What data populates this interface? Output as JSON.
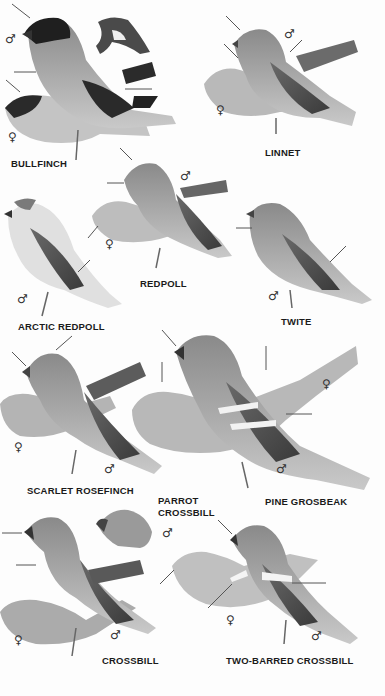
{
  "plate": {
    "title": "Finches plate",
    "background": "#fdfdfd"
  },
  "species": [
    {
      "id": "bullfinch",
      "label": "BULLFINCH",
      "sexes": [
        "male",
        "female"
      ]
    },
    {
      "id": "linnet",
      "label": "LINNET",
      "sexes": [
        "male",
        "female"
      ]
    },
    {
      "id": "redpoll",
      "label": "REDPOLL",
      "sexes": [
        "male",
        "female"
      ]
    },
    {
      "id": "arctic_redpoll",
      "label": "ARCTIC REDPOLL",
      "sexes": [
        "male"
      ]
    },
    {
      "id": "twite",
      "label": "TWITE",
      "sexes": [
        "male"
      ]
    },
    {
      "id": "scarlet_rosefinch",
      "label": "SCARLET ROSEFINCH",
      "sexes": [
        "female",
        "male"
      ]
    },
    {
      "id": "parrot_crossbill",
      "label_line1": "PARROT",
      "label_line2": "CROSSBILL",
      "sexes": [
        "male"
      ]
    },
    {
      "id": "pine_grosbeak",
      "label": "PINE GROSBEAK",
      "sexes": [
        "female",
        "male"
      ]
    },
    {
      "id": "crossbill",
      "label": "CROSSBILL",
      "sexes": [
        "female",
        "male"
      ]
    },
    {
      "id": "two_barred_crossbill",
      "label": "TWO-BARRED CROSSBILL",
      "sexes": [
        "female",
        "male"
      ]
    }
  ],
  "symbols": {
    "male": "♂",
    "female": "♀"
  }
}
